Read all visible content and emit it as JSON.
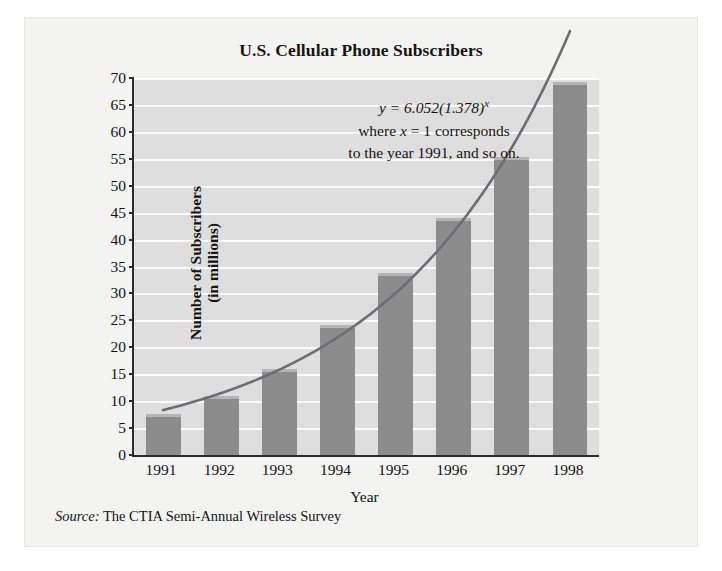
{
  "figure": {
    "title": "U.S. Cellular Phone Subscribers",
    "source_label": "Source:",
    "source_text": "The CTIA Semi-Annual Wireless Survey"
  },
  "annotation": {
    "equation_lhs": "y = 6.052(1.378)",
    "equation_exponent": "x",
    "line2_pre": "where ",
    "line2_var": "x",
    "line2_post": " = 1 corresponds",
    "line3": "to the year 1991, and so on."
  },
  "chart_data": {
    "type": "bar",
    "title": "U.S. Cellular Phone Subscribers",
    "xlabel": "Year",
    "ylabel": "Number of Subscribers (in millions)",
    "ylabel_line1": "Number of Subscribers",
    "ylabel_line2": "(in millions)",
    "categories": [
      "1991",
      "1992",
      "1993",
      "1994",
      "1995",
      "1996",
      "1997",
      "1998"
    ],
    "values": [
      7.6,
      11.0,
      16.0,
      24.1,
      33.8,
      44.0,
      55.3,
      69.2
    ],
    "ylim": [
      0,
      70
    ],
    "ytick_step": 5,
    "yticks": [
      0,
      5,
      10,
      15,
      20,
      25,
      30,
      35,
      40,
      45,
      50,
      55,
      60,
      65,
      70
    ],
    "ytick_labels": [
      "0",
      "5",
      "10",
      "15",
      "20",
      "25",
      "30",
      "35",
      "40",
      "45",
      "50",
      "55",
      "60",
      "65",
      "70"
    ],
    "grid": true,
    "legend": "none",
    "overlay_curve": {
      "label": "y = 6.052(1.378)^x",
      "model": "exponential",
      "a": 6.052,
      "b": 1.378,
      "x_of_first_category": 1,
      "color": "#6e6e72"
    },
    "colors": {
      "bar_fill": "#8c8c8c",
      "bar_top_edge": "#b5b5b5",
      "plot_background": "#dedede",
      "gridline": "#fbfbfb",
      "axis": "#2b2b2b",
      "figure_background": "#f3f3f1",
      "text": "#141414"
    }
  }
}
